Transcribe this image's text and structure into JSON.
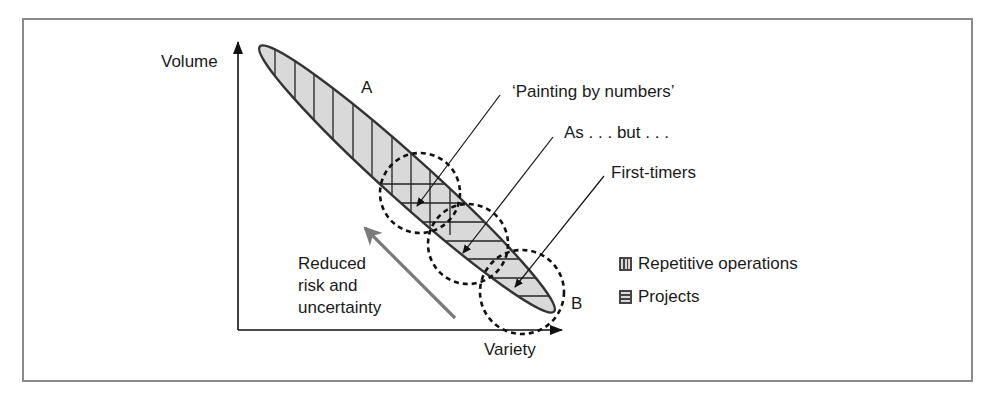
{
  "diagram": {
    "axes": {
      "y_label": "Volume",
      "x_label": "Variety"
    },
    "regions": {
      "top_label": "A",
      "bottom_label": "B"
    },
    "callouts": [
      {
        "label": "‘Painting by numbers’"
      },
      {
        "label": "As . . . but . . ."
      },
      {
        "label": "First-timers"
      }
    ],
    "trend_arrow": {
      "label_lines": [
        "Reduced",
        "risk and",
        "uncertainty"
      ]
    },
    "legend": [
      {
        "pattern": "vertical-hatch",
        "label": "Repetitive operations"
      },
      {
        "pattern": "horizontal-hatch",
        "label": "Projects"
      }
    ],
    "colors": {
      "fill": "#d9d9d9",
      "stroke": "#333333",
      "trend_arrow": "#7a7a7a",
      "frame": "#8a8a8a"
    }
  }
}
